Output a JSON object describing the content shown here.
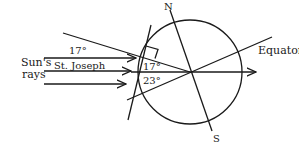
{
  "diagram": {
    "title": "",
    "labels": {
      "suns_rays_line1": "Sun's",
      "suns_rays_line2": "rays",
      "top_angle": "17°",
      "location": "St. Joseph",
      "inner_angle_upper": "17°",
      "inner_angle_lower": "23°",
      "north": "N",
      "south": "S",
      "equator": "Equator"
    },
    "rays_count": 3,
    "colors": {
      "ink": "#1a1a1a",
      "background": "#ffffff"
    }
  }
}
